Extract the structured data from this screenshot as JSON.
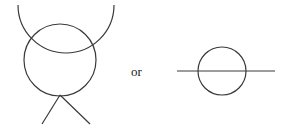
{
  "diagram": {
    "left_figure": {
      "description": "circle with large arc over top and two legs below",
      "arc": {
        "cx": 65,
        "cy": 5,
        "r": 48
      },
      "circle": {
        "cx": 60,
        "cy": 61,
        "r": 36
      },
      "legs": [
        {
          "x1": 60,
          "y1": 95,
          "x2": 42,
          "y2": 124
        },
        {
          "x1": 60,
          "y1": 95,
          "x2": 90,
          "y2": 124
        }
      ]
    },
    "connector_text": "or",
    "right_figure": {
      "description": "circle bisected by horizontal line",
      "circle": {
        "cx": 222,
        "cy": 71,
        "r": 24
      },
      "line": {
        "x1": 177,
        "y1": 71,
        "x2": 275,
        "y2": 71
      }
    },
    "stroke_color": "#3a3a3a"
  }
}
